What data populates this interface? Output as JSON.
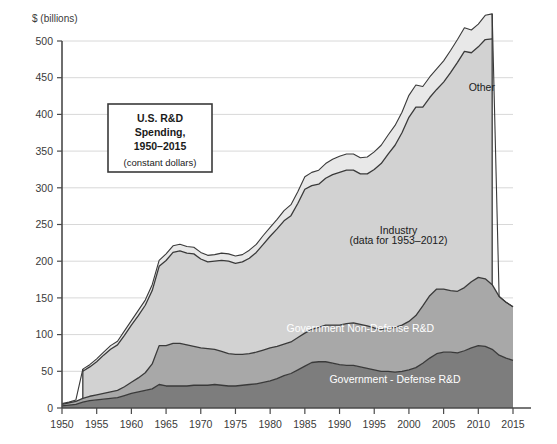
{
  "chart_data": {
    "type": "area",
    "stacked": true,
    "title_lines": [
      "U.S. R&D",
      "Spending,",
      "1950–2015"
    ],
    "subtitle": "(constant dollars)",
    "xlabel": "",
    "ylabel": "$ (billions)",
    "xlim": [
      1950,
      2015
    ],
    "ylim": [
      0,
      500
    ],
    "xticks": [
      1950,
      1955,
      1960,
      1965,
      1970,
      1975,
      1980,
      1985,
      1990,
      1995,
      2000,
      2005,
      2010,
      2015
    ],
    "yticks": [
      0,
      50,
      100,
      150,
      200,
      250,
      300,
      350,
      400,
      450,
      500
    ],
    "grid": "horizontal",
    "legend_position": "inline-annotations",
    "colors": {
      "defense": "#7d7d7d",
      "nondefense": "#a8a8a8",
      "industry": "#d2d2d2",
      "other": "#e8e8e8",
      "outline": "#3a3a3a",
      "grid": "#d8d8d8",
      "axis": "#4a4a4a"
    },
    "annotations": [
      {
        "name": "other-label",
        "text": "Other",
        "x": 2010.5,
        "y": 432,
        "style": "dark"
      },
      {
        "name": "industry-label-line1",
        "text": "Industry",
        "x": 1998.5,
        "y": 237,
        "style": "dark"
      },
      {
        "name": "industry-label-line2",
        "text": "(data for 1953–2012)",
        "x": 1998.5,
        "y": 223,
        "style": "dark"
      },
      {
        "name": "nondefense-label",
        "text": "Government Non-Defense R&D",
        "x": 1993,
        "y": 103,
        "style": "light"
      },
      {
        "name": "defense-label",
        "text": "Government - Defense R&D",
        "x": 1998,
        "y": 34,
        "style": "light"
      }
    ],
    "x": [
      1950,
      1951,
      1952,
      1953,
      1954,
      1955,
      1956,
      1957,
      1958,
      1959,
      1960,
      1961,
      1962,
      1963,
      1964,
      1965,
      1966,
      1967,
      1968,
      1969,
      1970,
      1971,
      1972,
      1973,
      1974,
      1975,
      1976,
      1977,
      1978,
      1979,
      1980,
      1981,
      1982,
      1983,
      1984,
      1985,
      1986,
      1987,
      1988,
      1989,
      1990,
      1991,
      1992,
      1993,
      1994,
      1995,
      1996,
      1997,
      1998,
      1999,
      2000,
      2001,
      2002,
      2003,
      2004,
      2005,
      2006,
      2007,
      2008,
      2009,
      2010,
      2011,
      2012,
      2013,
      2014,
      2015
    ],
    "series": [
      {
        "name": "Government - Defense R&D",
        "key": "defense",
        "values": [
          3,
          4,
          5,
          8,
          10,
          11,
          12,
          13,
          14,
          17,
          20,
          22,
          24,
          26,
          32,
          30,
          30,
          30,
          30,
          31,
          31,
          31,
          32,
          31,
          30,
          30,
          31,
          32,
          33,
          35,
          37,
          40,
          44,
          47,
          52,
          57,
          62,
          63,
          63,
          61,
          59,
          58,
          58,
          56,
          54,
          52,
          50,
          50,
          49,
          50,
          52,
          55,
          61,
          68,
          74,
          76,
          76,
          75,
          78,
          82,
          85,
          84,
          80,
          72,
          68,
          65
        ]
      },
      {
        "name": "Government Non-Defense R&D",
        "key": "nondefense",
        "values": [
          2,
          3,
          4,
          5,
          6,
          7,
          8,
          9,
          10,
          12,
          15,
          19,
          24,
          34,
          53,
          55,
          58,
          58,
          56,
          53,
          51,
          50,
          48,
          46,
          44,
          43,
          42,
          42,
          43,
          44,
          45,
          44,
          43,
          43,
          44,
          45,
          45,
          47,
          50,
          52,
          54,
          57,
          58,
          58,
          58,
          57,
          57,
          58,
          61,
          63,
          66,
          71,
          78,
          85,
          88,
          86,
          84,
          84,
          86,
          90,
          93,
          92,
          88,
          80,
          76,
          73
        ]
      },
      {
        "name": "Industry",
        "key": "industry",
        "values": [
          null,
          null,
          null,
          37,
          40,
          45,
          52,
          58,
          62,
          70,
          78,
          85,
          92,
          100,
          108,
          116,
          124,
          126,
          125,
          126,
          121,
          118,
          120,
          124,
          126,
          124,
          126,
          130,
          136,
          144,
          152,
          160,
          168,
          172,
          183,
          196,
          196,
          195,
          200,
          205,
          208,
          209,
          208,
          205,
          207,
          216,
          226,
          238,
          248,
          262,
          278,
          284,
          271,
          270,
          272,
          282,
          297,
          312,
          322,
          312,
          314,
          326,
          335,
          null,
          null,
          null
        ]
      },
      {
        "name": "Other",
        "key": "other",
        "values": [
          1,
          1,
          2,
          3,
          3,
          4,
          4,
          5,
          5,
          6,
          6,
          7,
          7,
          8,
          8,
          9,
          9,
          9,
          9,
          9,
          9,
          9,
          9,
          10,
          10,
          10,
          10,
          11,
          11,
          12,
          12,
          13,
          14,
          15,
          16,
          17,
          18,
          19,
          20,
          21,
          22,
          22,
          22,
          22,
          23,
          24,
          25,
          26,
          27,
          28,
          30,
          30,
          28,
          28,
          28,
          29,
          30,
          31,
          32,
          31,
          31,
          33,
          34,
          0,
          0,
          0
        ]
      }
    ]
  }
}
